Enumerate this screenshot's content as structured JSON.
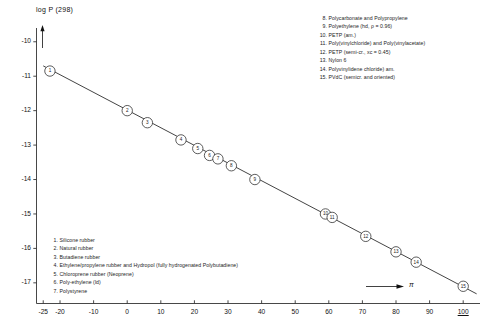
{
  "chart_data": {
    "type": "scatter",
    "title": "",
    "ylabel": "log P (298)",
    "xlabel": "π",
    "xlim": [
      -27,
      105
    ],
    "ylim": [
      -17.6,
      -9.6
    ],
    "grid": false,
    "legend_position": "split: upper-right (8-15), lower-left (1-7)",
    "x": [
      -23,
      0,
      6,
      16,
      21,
      24.5,
      27,
      31,
      38,
      59,
      61,
      71,
      80,
      86,
      100
    ],
    "y": [
      -10.85,
      -12.0,
      -12.35,
      -12.85,
      -13.1,
      -13.3,
      -13.4,
      -13.6,
      -14.0,
      -15.0,
      -15.1,
      -15.65,
      -16.1,
      -16.4,
      -17.1
    ],
    "point_labels": [
      "1",
      "2",
      "3",
      "4",
      "5",
      "6",
      "7",
      "8",
      "9",
      "10",
      "11",
      "12",
      "13",
      "14",
      "15"
    ],
    "trendline": {
      "x_start": -25,
      "y_start": -10.7,
      "x_end": 104,
      "y_end": -17.32
    },
    "xticks": [
      -25,
      -20,
      -10,
      0,
      10,
      20,
      30,
      40,
      50,
      60,
      70,
      80,
      90,
      100
    ],
    "xtick_labels": [
      "-25",
      "-20",
      "-10",
      "0",
      "10",
      "20",
      "30",
      "40",
      "50",
      "60",
      "70",
      "80",
      "90",
      "100"
    ],
    "yticks": [
      -10,
      -11,
      -12,
      -13,
      -14,
      -15,
      -16,
      -17
    ],
    "ytick_labels": [
      "-10",
      "-11",
      "-12",
      "-13",
      "-14",
      "-15",
      "-16",
      "-17"
    ],
    "series_name": "Polymer permeability",
    "line_color": "#222222",
    "marker_fill": "#ffffff",
    "marker_edge": "#333333"
  },
  "axes": {
    "y_title": "log P (298)",
    "x_title": "π"
  },
  "legend_upper": {
    "items": [
      {
        "num": "8.",
        "text": "Polycarbonate and Polypropylene"
      },
      {
        "num": "9.",
        "text": "Polyethylene (hd, ρ = 0.96)"
      },
      {
        "num": "10.",
        "text": "PETP (am.)"
      },
      {
        "num": "11.",
        "text": "Poly(vinylchloride) and Poly(vinylacetate)"
      },
      {
        "num": "12.",
        "text": "PETP (semi-cr., xᴄ = 0.45)"
      },
      {
        "num": "13.",
        "text": "Nylon 6"
      },
      {
        "num": "14.",
        "text": "Polyvinylidene chloride) am."
      },
      {
        "num": "15.",
        "text": "PVdC (semicr. and oriented)"
      }
    ]
  },
  "legend_lower": {
    "items": [
      {
        "num": "1.",
        "text": "Silicone rubber"
      },
      {
        "num": "2.",
        "text": "Natural rubber"
      },
      {
        "num": "3.",
        "text": "Butadiene rubber"
      },
      {
        "num": "4.",
        "text": "Ethylene/propylene rubber and Hydropol (fully hydrogenated Polybutadiene)"
      },
      {
        "num": "5.",
        "text": "Chloroprene rubber (Neoprene)"
      },
      {
        "num": "6.",
        "text": "Poly-ethylene (ld)"
      },
      {
        "num": "7.",
        "text": "Polystyrene"
      }
    ]
  }
}
